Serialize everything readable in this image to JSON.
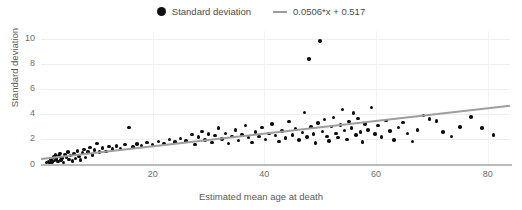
{
  "chart_data": {
    "type": "scatter",
    "title": "",
    "xlabel": "Estimated mean age at death",
    "ylabel": "Standard deviation",
    "xlim": [
      0,
      84
    ],
    "ylim": [
      0,
      10.6
    ],
    "xticks": [
      20,
      40,
      60,
      80
    ],
    "yticks": [
      0,
      2,
      4,
      6,
      8,
      10
    ],
    "grid": true,
    "legend_position": "top-center",
    "legend": [
      {
        "label": "Standard deviation",
        "marker": "circle",
        "color": "#0d0d0d"
      },
      {
        "label": "0.0506*x + 0.517",
        "marker": "line",
        "color": "#9e9e9e"
      }
    ],
    "series": [
      {
        "name": "Standard deviation",
        "marker": "circle",
        "color": "#0d0d0d",
        "points": [
          [
            1.0,
            0.1
          ],
          [
            1.3,
            0.2
          ],
          [
            1.5,
            0.05
          ],
          [
            1.8,
            0.35
          ],
          [
            2.0,
            0.15
          ],
          [
            2.2,
            0.55
          ],
          [
            2.4,
            0.28
          ],
          [
            2.6,
            0.7
          ],
          [
            2.8,
            0.4
          ],
          [
            3.0,
            0.18
          ],
          [
            3.2,
            0.62
          ],
          [
            3.4,
            0.85
          ],
          [
            3.6,
            0.3
          ],
          [
            3.8,
            0.48
          ],
          [
            4.0,
            0.12
          ],
          [
            4.3,
            0.75
          ],
          [
            4.6,
            0.55
          ],
          [
            4.8,
            0.95
          ],
          [
            5.0,
            0.35
          ],
          [
            5.3,
            0.68
          ],
          [
            5.6,
            0.22
          ],
          [
            5.9,
            0.8
          ],
          [
            6.2,
            0.45
          ],
          [
            6.5,
            1.05
          ],
          [
            6.8,
            0.6
          ],
          [
            7.1,
            0.3
          ],
          [
            7.4,
            0.88
          ],
          [
            7.7,
            1.15
          ],
          [
            8.0,
            0.52
          ],
          [
            8.4,
            0.95
          ],
          [
            8.8,
            1.3
          ],
          [
            9.2,
            0.7
          ],
          [
            9.6,
            1.1
          ],
          [
            10.0,
            1.62
          ],
          [
            10.5,
            0.95
          ],
          [
            11.0,
            1.28
          ],
          [
            11.6,
            1.0
          ],
          [
            12.2,
            1.4
          ],
          [
            12.8,
            1.18
          ],
          [
            13.5,
            1.45
          ],
          [
            14.2,
            1.22
          ],
          [
            15.0,
            1.55
          ],
          [
            15.8,
            2.9
          ],
          [
            16.5,
            1.35
          ],
          [
            17.2,
            1.6
          ],
          [
            18.0,
            1.48
          ],
          [
            19.0,
            1.7
          ],
          [
            20.0,
            1.55
          ],
          [
            21.0,
            1.8
          ],
          [
            22.0,
            1.62
          ],
          [
            23.0,
            1.95
          ],
          [
            24.0,
            1.75
          ],
          [
            25.0,
            2.05
          ],
          [
            26.0,
            1.85
          ],
          [
            27.0,
            2.35
          ],
          [
            27.6,
            1.55
          ],
          [
            28.2,
            2.15
          ],
          [
            28.8,
            2.6
          ],
          [
            29.4,
            1.92
          ],
          [
            30.0,
            2.4
          ],
          [
            30.6,
            1.7
          ],
          [
            31.2,
            2.28
          ],
          [
            31.8,
            2.85
          ],
          [
            32.4,
            1.98
          ],
          [
            33.0,
            2.45
          ],
          [
            33.6,
            1.62
          ],
          [
            34.2,
            2.2
          ],
          [
            34.8,
            2.72
          ],
          [
            35.4,
            1.88
          ],
          [
            36.0,
            2.35
          ],
          [
            36.6,
            3.05
          ],
          [
            37.2,
            2.1
          ],
          [
            37.8,
            1.72
          ],
          [
            38.4,
            2.55
          ],
          [
            39.0,
            2.18
          ],
          [
            39.6,
            2.9
          ],
          [
            40.2,
            1.95
          ],
          [
            40.8,
            2.42
          ],
          [
            41.4,
            3.2
          ],
          [
            42.0,
            2.28
          ],
          [
            42.6,
            1.8
          ],
          [
            43.2,
            2.65
          ],
          [
            43.8,
            2.08
          ],
          [
            44.4,
            3.4
          ],
          [
            45.0,
            2.32
          ],
          [
            45.6,
            2.78
          ],
          [
            46.2,
            1.92
          ],
          [
            46.8,
            2.5
          ],
          [
            47.2,
            4.1
          ],
          [
            47.6,
            2.15
          ],
          [
            48.0,
            8.35
          ],
          [
            48.4,
            2.95
          ],
          [
            48.8,
            2.38
          ],
          [
            49.2,
            1.68
          ],
          [
            49.6,
            3.25
          ],
          [
            50.0,
            9.8
          ],
          [
            50.4,
            2.6
          ],
          [
            50.8,
            3.55
          ],
          [
            51.2,
            2.2
          ],
          [
            51.6,
            1.85
          ],
          [
            52.0,
            2.98
          ],
          [
            52.4,
            3.72
          ],
          [
            52.8,
            2.45
          ],
          [
            53.2,
            2.1
          ],
          [
            53.6,
            3.1
          ],
          [
            54.0,
            4.35
          ],
          [
            54.4,
            2.68
          ],
          [
            54.8,
            1.95
          ],
          [
            55.2,
            3.4
          ],
          [
            55.6,
            2.88
          ],
          [
            56.0,
            4.05
          ],
          [
            56.4,
            2.3
          ],
          [
            56.8,
            3.62
          ],
          [
            57.2,
            2.55
          ],
          [
            57.6,
            1.75
          ],
          [
            58.0,
            3.18
          ],
          [
            58.6,
            2.72
          ],
          [
            59.2,
            4.5
          ],
          [
            59.8,
            2.4
          ],
          [
            60.4,
            3.05
          ],
          [
            61.0,
            2.15
          ],
          [
            61.8,
            3.48
          ],
          [
            62.5,
            2.62
          ],
          [
            63.2,
            1.9
          ],
          [
            64.0,
            2.92
          ],
          [
            64.8,
            3.3
          ],
          [
            65.6,
            2.45
          ],
          [
            66.5,
            1.78
          ],
          [
            67.4,
            2.7
          ],
          [
            68.5,
            3.88
          ],
          [
            69.6,
            3.6
          ],
          [
            70.8,
            3.42
          ],
          [
            72.0,
            2.55
          ],
          [
            73.5,
            2.18
          ],
          [
            75.0,
            2.95
          ],
          [
            77.0,
            3.75
          ],
          [
            79.0,
            2.85
          ],
          [
            81.0,
            2.3
          ]
        ]
      }
    ],
    "trendline": {
      "label": "0.0506*x + 0.517",
      "slope": 0.0506,
      "intercept": 0.517,
      "color": "#9e9e9e",
      "x_start": 0,
      "x_end": 84
    }
  }
}
